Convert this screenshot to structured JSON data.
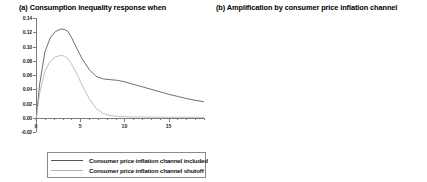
{
  "chart_data": [
    {
      "type": "line",
      "panel": "a",
      "title": "(a) Consumption inequality response when",
      "xlabel": "",
      "ylabel": "",
      "xlim": [
        0,
        19
      ],
      "ylim": [
        -0.02,
        0.14
      ],
      "grid": false,
      "xticks": [
        0,
        5,
        10,
        15
      ],
      "xtick_labels": [
        "0",
        "5",
        "10",
        "15"
      ],
      "yticks": [
        -0.02,
        0.0,
        0.02,
        0.04,
        0.06,
        0.08,
        0.1,
        0.12,
        0.14
      ],
      "ytick_labels": [
        "-0.02",
        "0.00",
        "0.02",
        "0.04",
        "0.06",
        "0.08",
        "0.10",
        "0.12",
        "0.14"
      ],
      "legend_position": "below",
      "series": [
        {
          "name": "Consumer price inflation channel included",
          "color": "#555555",
          "x": [
            0,
            0.4,
            1,
            1.6,
            2.2,
            2.8,
            3.2,
            3.6,
            4,
            4.6,
            5.2,
            6,
            6.8,
            7.6,
            8.4,
            9.2,
            10,
            11,
            12,
            13,
            14,
            15,
            16,
            17,
            18,
            19
          ],
          "values": [
            -0.004,
            0.046,
            0.092,
            0.112,
            0.121,
            0.1245,
            0.124,
            0.1215,
            0.113,
            0.098,
            0.083,
            0.068,
            0.058,
            0.0545,
            0.0535,
            0.0525,
            0.0505,
            0.047,
            0.0435,
            0.04,
            0.0365,
            0.033,
            0.03,
            0.027,
            0.0245,
            0.0225
          ]
        },
        {
          "name": "Consumer price inflation channel shutoff",
          "color": "#b2b2b2",
          "x": [
            0,
            0.4,
            1,
            1.6,
            2.2,
            2.8,
            3.2,
            3.6,
            4,
            4.6,
            5.2,
            6,
            6.8,
            7.6,
            8.4,
            9.2,
            10,
            11,
            12,
            13,
            14,
            15,
            16,
            17,
            18,
            19
          ],
          "values": [
            -0.004,
            0.034,
            0.065,
            0.079,
            0.0855,
            0.0875,
            0.0865,
            0.083,
            0.076,
            0.062,
            0.046,
            0.027,
            0.013,
            0.006,
            0.003,
            0.002,
            0.0015,
            0.001,
            0.001,
            0.0008,
            0.0008,
            0.0006,
            0.0006,
            0.0005,
            0.0005,
            0.0004
          ]
        }
      ]
    },
    {
      "type": "area",
      "panel": "b",
      "title": "(b) Amplification by consumer price inflation channel",
      "xlabel": "",
      "ylabel": "",
      "xlim": [
        0,
        19
      ],
      "ylim": [
        0.0,
        0.06
      ],
      "grid": false,
      "xticks": [
        0,
        5,
        10,
        15
      ],
      "xtick_labels": [
        "0",
        "5",
        "10",
        "15"
      ],
      "yticks": [
        0.0,
        0.01,
        0.02,
        0.03,
        0.04,
        0.05,
        0.06
      ],
      "ytick_labels": [
        "0.00",
        "0.01",
        "0.02",
        "0.03",
        "0.04",
        "0.05",
        "0.06"
      ],
      "fill_color": "#000000",
      "series": [
        {
          "name": "Amplification",
          "x": [
            0,
            0.3,
            0.8,
            1.4,
            2.0,
            2.6,
            3.0,
            3.4,
            3.8,
            4.2,
            4.6,
            5.0,
            5.4,
            5.8,
            6.2,
            6.6,
            7.0,
            7.4,
            7.8,
            8.2,
            8.6,
            9.0,
            9.6,
            10.2,
            11.0,
            11.8,
            12.6,
            13.4,
            14.2,
            15.0,
            15.8,
            16.6,
            17.4,
            18.2,
            18.8
          ],
          "values": [
            0.0,
            0.0105,
            0.0255,
            0.0315,
            0.0345,
            0.0355,
            0.0358,
            0.0352,
            0.0362,
            0.0392,
            0.0424,
            0.0452,
            0.0478,
            0.0498,
            0.0512,
            0.0528,
            0.0548,
            0.0562,
            0.057,
            0.0566,
            0.0548,
            0.0528,
            0.0496,
            0.0462,
            0.042,
            0.0386,
            0.0356,
            0.033,
            0.0308,
            0.0288,
            0.0272,
            0.0258,
            0.0246,
            0.0236,
            0.023
          ]
        }
      ]
    }
  ],
  "legend": {
    "items": [
      {
        "label": "Consumer price inflation channel included"
      },
      {
        "label": "Consumer price inflation channel shutoff"
      }
    ]
  }
}
